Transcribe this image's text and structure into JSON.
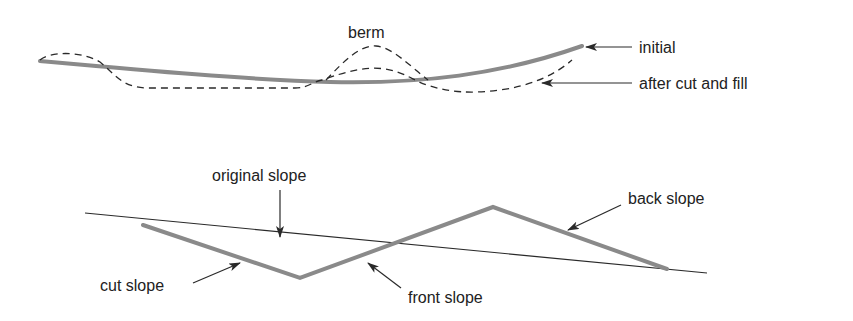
{
  "colors": {
    "background": "#ffffff",
    "profile_gray": "#8a8a8a",
    "line_dark": "#2a2a2a",
    "text": "#222222"
  },
  "top_diagram": {
    "labels": {
      "berm": "berm",
      "initial": "initial",
      "after_cut_and_fill": "after cut and fill"
    },
    "curves": {
      "initial": "solid thick gray",
      "after_cut_and_fill": "dashed thin dark",
      "berm_peak": "dashed thin dark"
    }
  },
  "bottom_diagram": {
    "labels": {
      "original_slope": "original slope",
      "cut_slope": "cut slope",
      "front_slope": "front slope",
      "back_slope": "back slope"
    },
    "lines": {
      "original_slope": "thin dark line",
      "cut_profile": "thick gray polyline"
    }
  }
}
